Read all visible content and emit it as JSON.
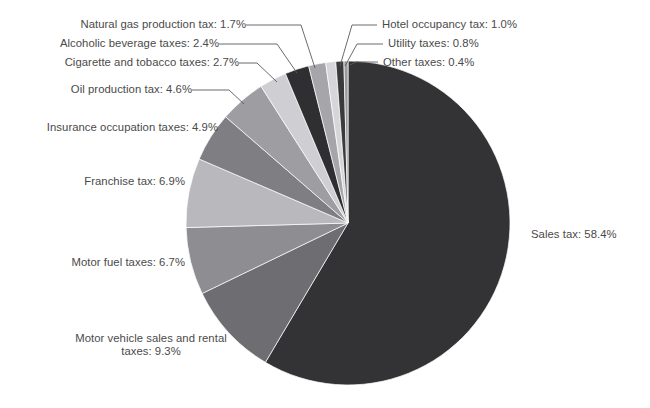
{
  "chart_data": {
    "type": "pie",
    "title": "",
    "subtitle": "",
    "xlabel": "",
    "ylabel": "",
    "legend_position": "none",
    "grid": false,
    "units": "percent",
    "start_angle_deg": 0,
    "direction": "clockwise",
    "categories": [
      "Sales tax",
      "Motor vehicle sales and rental taxes",
      "Motor fuel taxes",
      "Franchise tax",
      "Insurance occupation taxes",
      "Oil production tax",
      "Cigarette and tobacco taxes",
      "Alcoholic beverage taxes",
      "Natural gas production tax",
      "Hotel occupancy tax",
      "Utility taxes",
      "Other taxes"
    ],
    "values": [
      58.4,
      9.3,
      6.7,
      6.9,
      4.9,
      4.6,
      2.7,
      2.4,
      1.7,
      1.0,
      0.8,
      0.4
    ],
    "colors": [
      "#333335",
      "#6e6e72",
      "#8e8e92",
      "#b9b9bd",
      "#7e7e83",
      "#9d9da2",
      "#cfcfd3",
      "#2f2f32",
      "#a6a6aa",
      "#d6d6da",
      "#3a3a3d",
      "#9a9a9e"
    ],
    "slices": [
      {
        "label": "Sales tax",
        "value": 58.4,
        "text": "Sales tax: 58.4%",
        "color": "#333335"
      },
      {
        "label": "Motor vehicle sales and rental taxes",
        "value": 9.3,
        "text": "Motor vehicle sales and rental\ntaxes: 9.3%",
        "color": "#6e6e72"
      },
      {
        "label": "Motor fuel taxes",
        "value": 6.7,
        "text": "Motor fuel taxes: 6.7%",
        "color": "#8e8e92"
      },
      {
        "label": "Franchise tax",
        "value": 6.9,
        "text": "Franchise tax: 6.9%",
        "color": "#b9b9bd"
      },
      {
        "label": "Insurance occupation taxes",
        "value": 4.9,
        "text": "Insurance occupation taxes: 4.9%",
        "color": "#7e7e83"
      },
      {
        "label": "Oil production tax",
        "value": 4.6,
        "text": "Oil production tax: 4.6%",
        "color": "#9d9da2"
      },
      {
        "label": "Cigarette and tobacco taxes",
        "value": 2.7,
        "text": "Cigarette and tobacco taxes: 2.7%",
        "color": "#cfcfd3"
      },
      {
        "label": "Alcoholic beverage taxes",
        "value": 2.4,
        "text": "Alcoholic beverage taxes: 2.4%",
        "color": "#2f2f32"
      },
      {
        "label": "Natural gas production tax",
        "value": 1.7,
        "text": "Natural gas production tax: 1.7%",
        "color": "#a6a6aa"
      },
      {
        "label": "Hotel occupancy tax",
        "value": 1.0,
        "text": "Hotel occupancy tax: 1.0%",
        "color": "#d6d6da"
      },
      {
        "label": "Utility taxes",
        "value": 0.8,
        "text": "Utility taxes: 0.8%",
        "color": "#3a3a3d"
      },
      {
        "label": "Other taxes",
        "value": 0.4,
        "text": "Other taxes: 0.4%",
        "color": "#9a9a9e"
      }
    ]
  },
  "labels": {
    "sales_tax": "Sales tax: 58.4%",
    "motor_vehicle": "Motor vehicle sales and rental",
    "motor_vehicle2": "taxes: 9.3%",
    "motor_fuel": "Motor fuel taxes: 6.7%",
    "franchise": "Franchise tax: 6.9%",
    "insurance": "Insurance occupation taxes: 4.9%",
    "oil": "Oil production tax: 4.6%",
    "cigarette": "Cigarette and tobacco taxes: 2.7%",
    "alcohol": "Alcoholic beverage taxes: 2.4%",
    "natural_gas": "Natural gas production tax: 1.7%",
    "hotel": "Hotel occupancy tax: 1.0%",
    "utility": "Utility taxes: 0.8%",
    "other": "Other taxes: 0.4%"
  },
  "style": {
    "background": "#ffffff",
    "text_color": "#4a4a4a",
    "leader_color": "#5a5a5a"
  }
}
